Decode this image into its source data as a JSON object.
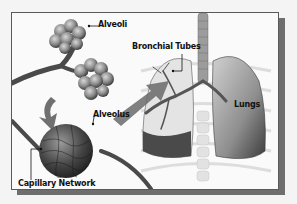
{
  "diagram": {
    "labels": {
      "alveoli": "Alveoli",
      "bronchial_tubes": "Bronchial Tubes",
      "alveolus": "Alveolus",
      "lungs": "Lungs",
      "capillary_network": "Capillary Network"
    },
    "colors": {
      "background": "#f4f4f4",
      "frame_border": "#5a5a5a",
      "frame_shadow": "#6e6e6e",
      "tissue_dark": "#555555",
      "tissue_light": "#b8b8b8",
      "arrow": "#6a6a6a"
    }
  }
}
